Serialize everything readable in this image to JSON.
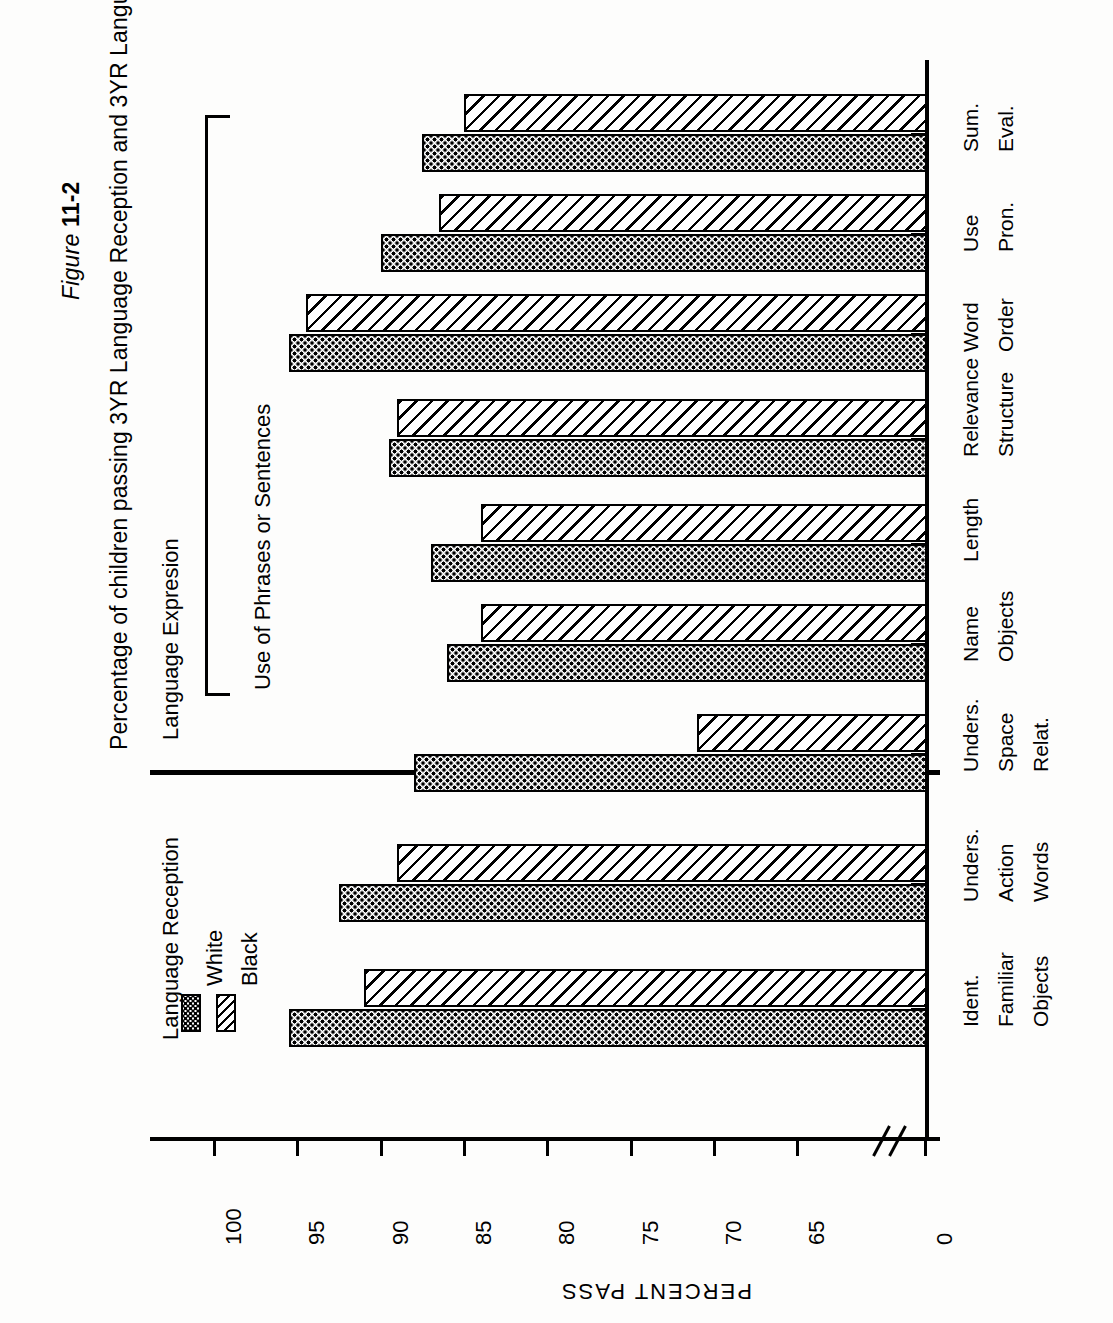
{
  "figure": {
    "number_prefix": "Figure ",
    "number": "11-2",
    "title": "Percentage of children passing 3YR Language Reception and 3YR Language Expression by race"
  },
  "sections": {
    "reception": "Language Reception",
    "expression": "Language Expresion",
    "bracket": "Use of Phrases or Sentences"
  },
  "legend": {
    "items": [
      {
        "label": "White",
        "pattern": "dotted-checker"
      },
      {
        "label": "Black",
        "pattern": "diagonal-hatch"
      }
    ]
  },
  "axis": {
    "title": "PERCENT PASS",
    "ticks": [
      "100",
      "95",
      "90",
      "85",
      "80",
      "75",
      "70",
      "65",
      "0"
    ],
    "has_break": true
  },
  "chart_data": {
    "type": "bar",
    "title": "Percentage of children passing 3YR Language Reception and 3YR Language Expression by race",
    "xlabel": "",
    "ylabel": "PERCENT PASS",
    "ylim": [
      0,
      100
    ],
    "orientation": "horizontal",
    "grid": false,
    "legend_position": "top-left",
    "categories": [
      "Ident. Familiar Objects",
      "Unders. Action Words",
      "Unders. Space Relat.",
      "Name Objects",
      "Length Structure",
      "Relevance",
      "Word Order",
      "Use Pron.",
      "Sum. Eval."
    ],
    "category_lines": [
      [
        "Ident.",
        "Familiar",
        "Objects"
      ],
      [
        "Unders.",
        "Action",
        "Words"
      ],
      [
        "Unders.",
        "Space",
        "Relat."
      ],
      [
        "Name",
        "Objects",
        ""
      ],
      [
        "Length",
        "",
        ""
      ],
      [
        "Relevance",
        "Structure",
        ""
      ],
      [
        "Word",
        "Order",
        ""
      ],
      [
        "Use",
        "Pron.",
        ""
      ],
      [
        "Sum.",
        "Eval.",
        ""
      ]
    ],
    "series": [
      {
        "name": "White",
        "values": [
          95.5,
          92.5,
          88.0,
          86.0,
          87.0,
          89.5,
          95.5,
          90.0,
          87.5
        ]
      },
      {
        "name": "Black",
        "values": [
          91.0,
          89.0,
          71.0,
          84.0,
          84.0,
          89.0,
          94.5,
          86.5,
          85.0
        ]
      }
    ]
  }
}
